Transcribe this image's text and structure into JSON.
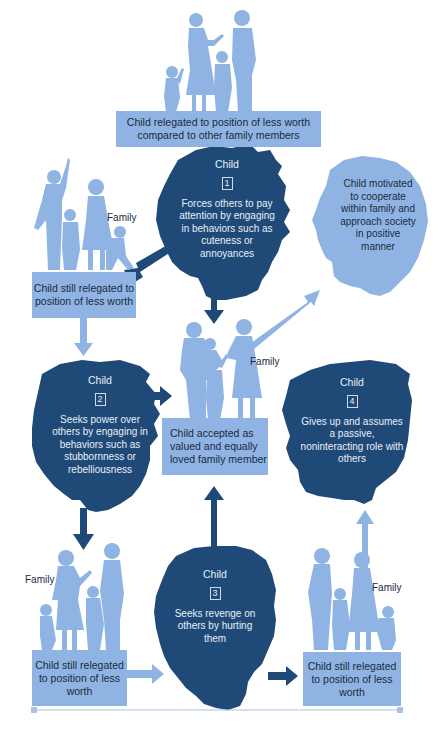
{
  "colors": {
    "dark_blue": "#1f4a78",
    "light_blue": "#8fb4e3",
    "text_dark": "#1c2a3e",
    "text_light": "#e8eef7",
    "background": "#ffffff"
  },
  "top_box": {
    "text": "Child relegated to position of less worth compared to other family members"
  },
  "stage1": {
    "title": "Child",
    "number": "1",
    "text": "Forces others to pay attention by engaging in behaviors such as cuteness or annoyances"
  },
  "stage2": {
    "title": "Child",
    "number": "2",
    "text": "Seeks power over others by engaging in behaviors such as stubbornness or rebelliousness"
  },
  "stage3": {
    "title": "Child",
    "number": "3",
    "text": "Seeks revenge on others by hurting them"
  },
  "stage4": {
    "title": "Child",
    "number": "4",
    "text": "Gives up and assumes a passive, noninteracting role with others"
  },
  "positive_head": {
    "text": "Child motivated to cooperate within family and approach society in positive manner"
  },
  "center_box": {
    "text": "Child accepted as valued and equally loved family member",
    "family_label": "Family"
  },
  "left_top_box": {
    "text": "Child still relegated to position of less worth",
    "family_label": "Family"
  },
  "left_bottom_box": {
    "text": "Child still relegated to position of less worth",
    "family_label": "Family"
  },
  "right_bottom_box": {
    "text": "Child still relegated to position of less worth",
    "family_label": "Family"
  }
}
